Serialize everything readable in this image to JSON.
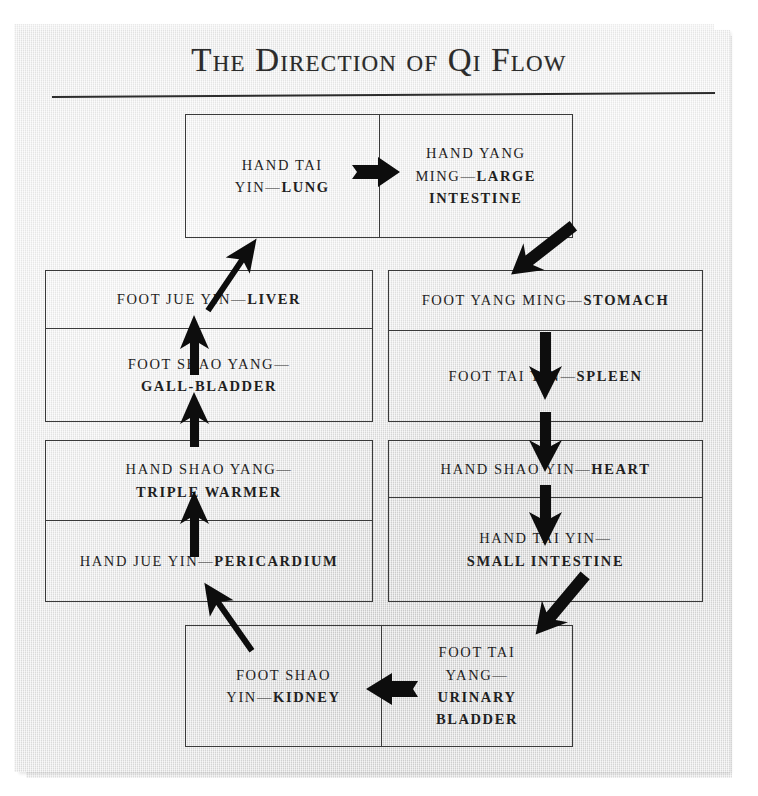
{
  "title": "The Direction of Qi Flow",
  "colors": {
    "paper": "#e9e9e9",
    "ink": "#1f1f1f",
    "rule": "#2c2c2c",
    "arrow": "#0d0d0d"
  },
  "diagram": {
    "type": "cycle-flow",
    "groups": {
      "top": {
        "orientation": "horizontal",
        "cells": [
          {
            "prefix": "Hand Tai Yin—",
            "organ": "Lung",
            "line1": "HAND TAI",
            "line2_prefix": "YIN—",
            "line2_organ": "LUNG"
          },
          {
            "prefix": "Hand Yang Ming—",
            "organ": "Large Intestine",
            "line1": "HAND YANG",
            "line2_prefix": "MING—",
            "line2_organ": "LARGE",
            "line3_organ": "INTESTINE"
          }
        ]
      },
      "left_upper": {
        "orientation": "vertical",
        "cells": [
          {
            "prefix": "FOOT JUE YIN—",
            "organ": "LIVER"
          },
          {
            "prefix": "FOOT SHAO YANG—",
            "organ": "GALL-BLADDER"
          }
        ]
      },
      "left_lower": {
        "orientation": "vertical",
        "cells": [
          {
            "prefix": "HAND SHAO YANG—",
            "organ": "TRIPLE WARMER"
          },
          {
            "prefix": "HAND JUE YIN—",
            "organ": "PERICARDIUM"
          }
        ]
      },
      "right_upper": {
        "orientation": "vertical",
        "cells": [
          {
            "prefix": "FOOT YANG MING—",
            "organ": "STOMACH"
          },
          {
            "prefix": "FOOT TAI YIN—",
            "organ": "SPLEEN"
          }
        ]
      },
      "right_lower": {
        "orientation": "vertical",
        "cells": [
          {
            "prefix": "HAND SHAO YIN—",
            "organ": "HEART"
          },
          {
            "prefix": "HAND TAI YIN—",
            "organ": "SMALL INTESTINE"
          }
        ]
      },
      "bottom": {
        "orientation": "horizontal",
        "cells": [
          {
            "line1": "FOOT SHAO",
            "line2_prefix": "YIN—",
            "line2_organ": "KIDNEY"
          },
          {
            "line1": "FOOT TAI",
            "line2": "YANG—",
            "line3_organ": "URINARY",
            "line4_organ": "BLADDER"
          }
        ]
      }
    },
    "meridian_sequence": [
      "Hand Tai Yin—Lung",
      "Hand Yang Ming—Large Intestine",
      "Foot Yang Ming—Stomach",
      "Foot Tai Yin—Spleen",
      "Hand Shao Yin—Heart",
      "Hand Tai Yin—Small Intestine",
      "Foot Tai Yang—Urinary Bladder",
      "Foot Shao Yin—Kidney",
      "Hand Jue Yin—Pericardium",
      "Hand Shao Yang—Triple Warmer",
      "Foot Shao Yang—Gall-Bladder",
      "Foot Jue Yin—Liver"
    ],
    "arrows": [
      {
        "name": "lung-to-large-intestine",
        "direction": "right"
      },
      {
        "name": "large-intestine-to-stomach",
        "direction": "down-right"
      },
      {
        "name": "stomach-to-spleen",
        "direction": "down"
      },
      {
        "name": "spleen-to-heart",
        "direction": "down"
      },
      {
        "name": "heart-to-small-intestine",
        "direction": "down"
      },
      {
        "name": "small-intestine-to-urinary-bladder",
        "direction": "down-right"
      },
      {
        "name": "urinary-bladder-to-kidney",
        "direction": "left"
      },
      {
        "name": "kidney-to-pericardium",
        "direction": "up-left"
      },
      {
        "name": "pericardium-to-triple-warmer",
        "direction": "up"
      },
      {
        "name": "triple-warmer-to-gall-bladder",
        "direction": "up"
      },
      {
        "name": "gall-bladder-to-liver",
        "direction": "up"
      },
      {
        "name": "liver-to-lung",
        "direction": "up-right"
      }
    ]
  }
}
